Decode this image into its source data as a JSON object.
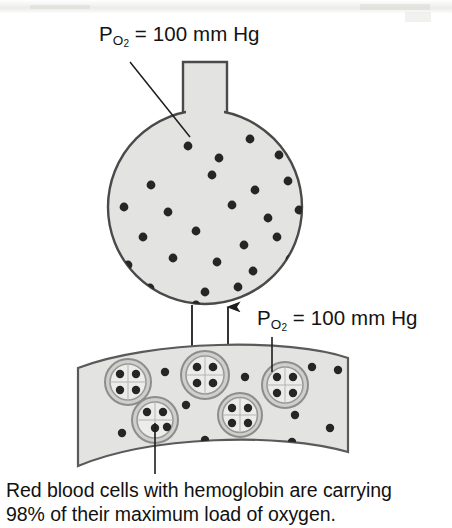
{
  "diagram": {
    "labels": {
      "alveolus_po2": {
        "prefix": "P",
        "subscript": "O2",
        "value": "= 100 mm Hg",
        "full_text": "PO2 = 100 mm Hg"
      },
      "capillary_po2": {
        "prefix": "P",
        "subscript": "O2",
        "value": "= 100 mm Hg",
        "full_text": "PO2 = 100 mm Hg"
      }
    },
    "caption": {
      "line1": "Red blood cells with hemoglobin are carrying",
      "line2": "98% of their maximum load of oxygen.",
      "percent": "98%"
    },
    "colors": {
      "structure_fill": "#e3e3e1",
      "structure_outline": "#4a4a4a",
      "oxygen_dot": "#262626",
      "rbc_membrane": "#9a9a98",
      "rbc_interior": "#e9e9e7",
      "background": "#ffffff",
      "text": "#131313"
    },
    "alveolus": {
      "name": "alveolus",
      "shape": "sphere-with-neck",
      "center_x": 205,
      "center_y": 207,
      "radius": 97,
      "neck": {
        "x": 183,
        "y": 63,
        "width": 44,
        "height": 52
      },
      "oxygen_count": 26,
      "oxygen_dots": [
        [
          188,
          146
        ],
        [
          219,
          158
        ],
        [
          250,
          139
        ],
        [
          279,
          155
        ],
        [
          151,
          185
        ],
        [
          212,
          175
        ],
        [
          255,
          190
        ],
        [
          288,
          181
        ],
        [
          124,
          207
        ],
        [
          168,
          212
        ],
        [
          232,
          205
        ],
        [
          268,
          218
        ],
        [
          299,
          210
        ],
        [
          143,
          237
        ],
        [
          196,
          231
        ],
        [
          244,
          245
        ],
        [
          277,
          237
        ],
        [
          128,
          265
        ],
        [
          173,
          258
        ],
        [
          217,
          262
        ],
        [
          253,
          271
        ],
        [
          290,
          259
        ],
        [
          150,
          288
        ],
        [
          205,
          292
        ],
        [
          238,
          287
        ],
        [
          196,
          305
        ]
      ]
    },
    "capillary": {
      "name": "pulmonary-capillary",
      "shape": "curved-band",
      "left_x": 78,
      "right_x": 348,
      "free_oxygen_dots": [
        [
          165,
          372
        ],
        [
          245,
          377
        ],
        [
          312,
          367
        ],
        [
          338,
          370
        ],
        [
          186,
          405
        ],
        [
          250,
          400
        ],
        [
          295,
          415
        ],
        [
          122,
          433
        ],
        [
          205,
          440
        ],
        [
          292,
          442
        ],
        [
          330,
          428
        ]
      ],
      "free_oxygen_count": 11,
      "red_blood_cells": [
        {
          "cx": 128,
          "cy": 382,
          "r": 23,
          "oxygen_in_cell": 4,
          "label": "red-blood-cell-1"
        },
        {
          "cx": 205,
          "cy": 375,
          "r": 24,
          "oxygen_in_cell": 4,
          "label": "red-blood-cell-2"
        },
        {
          "cx": 285,
          "cy": 385,
          "r": 23,
          "oxygen_in_cell": 4,
          "label": "red-blood-cell-3"
        },
        {
          "cx": 155,
          "cy": 420,
          "r": 23,
          "oxygen_in_cell": 4,
          "label": "red-blood-cell-4"
        },
        {
          "cx": 240,
          "cy": 415,
          "r": 22,
          "oxygen_in_cell": 4,
          "label": "red-blood-cell-5"
        }
      ],
      "cell_count": 5,
      "oxygen_per_cell": 4
    },
    "arrows": [
      {
        "name": "arrow-into-capillary",
        "direction": "down",
        "x": 192,
        "y_start": 305,
        "y_end": 366
      },
      {
        "name": "arrow-into-alveolus",
        "direction": "up",
        "x": 228,
        "y_start": 368,
        "y_end": 303
      }
    ],
    "leader_lines": [
      {
        "name": "leader-alveolus-label",
        "type": "diagonal",
        "x1": 130,
        "y1": 62,
        "x2": 190,
        "y2": 137
      },
      {
        "name": "leader-capillary-label",
        "type": "vertical",
        "x1": 272,
        "y1": 337,
        "x2": 272,
        "y2": 372
      },
      {
        "name": "leader-rbc-caption",
        "type": "vertical",
        "x1": 155,
        "y1": 423,
        "x2": 155,
        "y2": 474
      }
    ]
  }
}
